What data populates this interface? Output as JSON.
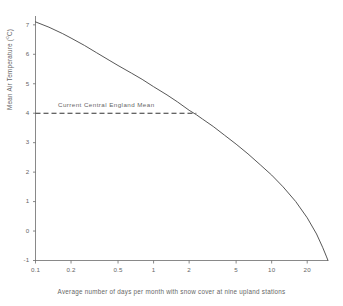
{
  "chart_data": {
    "type": "line",
    "title": "",
    "xlabel": "Average number of days per month with snow cover at nine upland stations",
    "ylabel": "Mean Air Temperature (°C)",
    "xscale": "log",
    "xlim": [
      0.1,
      30
    ],
    "ylim": [
      -1,
      7.3
    ],
    "grid": false,
    "legend_position": "none",
    "x_ticks": [
      0.1,
      0.2,
      0.5,
      1,
      2,
      5,
      10,
      20
    ],
    "x_tick_labels": [
      "0.1",
      "0.2",
      "0.5",
      "1",
      "2",
      "5",
      "10",
      "20"
    ],
    "y_ticks": [
      -1,
      0,
      1,
      2,
      3,
      4,
      5,
      6,
      7
    ],
    "y_tick_labels": [
      "-1",
      "0",
      "1",
      "2",
      "3",
      "4",
      "5",
      "6",
      "7"
    ],
    "series": [
      {
        "name": "Mean air temperature vs snow cover days",
        "style": "solid",
        "color": "#444444",
        "x": [
          0.1,
          0.13,
          0.17,
          0.2,
          0.26,
          0.33,
          0.42,
          0.5,
          0.65,
          0.8,
          1.0,
          1.3,
          1.6,
          2.0,
          2.3,
          2.6,
          3.2,
          4.0,
          5.0,
          6.3,
          8.0,
          10.0,
          12.5,
          16.0,
          20.0,
          24.0,
          27.0,
          29.0,
          30.0
        ],
        "y": [
          7.1,
          6.92,
          6.7,
          6.55,
          6.3,
          6.05,
          5.8,
          5.62,
          5.36,
          5.15,
          4.9,
          4.62,
          4.38,
          4.1,
          3.95,
          3.8,
          3.55,
          3.25,
          2.95,
          2.62,
          2.25,
          1.9,
          1.5,
          1.0,
          0.45,
          -0.1,
          -0.55,
          -0.85,
          -1.0
        ]
      }
    ],
    "annotations": [
      {
        "name": "current-central-england-mean",
        "label": "Current Central England Mean",
        "type": "horizontal-dashed-line",
        "y_value": 4,
        "x_start": 0.1,
        "x_end": 2.3,
        "color": "#333333"
      }
    ]
  },
  "axes": {
    "y_title_main": "Mean Air Temperature (",
    "y_title_degree": "o",
    "y_title_close": "C)",
    "x_title": "Average number of days per month with snow cover at nine upland stations"
  }
}
